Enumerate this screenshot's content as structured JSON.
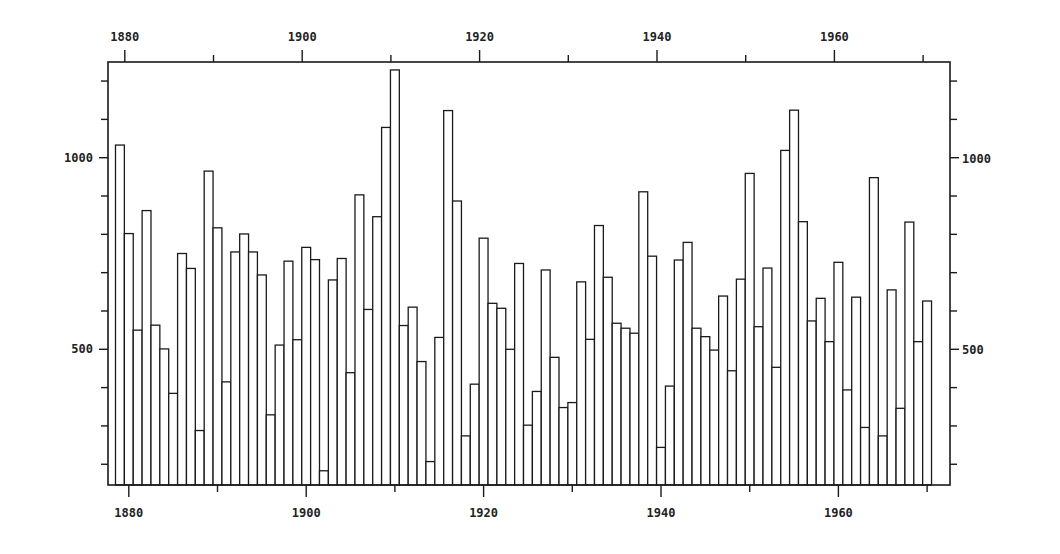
{
  "chart_data": {
    "type": "bar",
    "title": "",
    "xlabel": "",
    "ylabel": "",
    "x_tick_labels_bottom": [
      "1880",
      "1900",
      "1920",
      "1940",
      "1960"
    ],
    "x_tick_labels_top": [
      "1880",
      "1900",
      "1920",
      "1940",
      "1960"
    ],
    "y_tick_labels_left": [
      "500",
      "1000"
    ],
    "y_tick_labels_right": [
      "500",
      "1000"
    ],
    "xlim": [
      1878.5,
      1978
    ],
    "ylim": [
      143,
      1250
    ],
    "y_minor_tick_step": 100,
    "y_minor_ticks": [
      200,
      300,
      400,
      500,
      600,
      700,
      800,
      900,
      1000,
      1100,
      1200
    ],
    "x_minor_ticks": [
      1880,
      1890,
      1900,
      1910,
      1920,
      1930,
      1940,
      1950,
      1960,
      1970
    ],
    "grid": false,
    "legend": null,
    "style": "outlined histogram bars, no fill",
    "categories": [
      1879,
      1880,
      1881,
      1882,
      1883,
      1884,
      1885,
      1886,
      1887,
      1888,
      1889,
      1890,
      1891,
      1892,
      1893,
      1894,
      1895,
      1896,
      1897,
      1898,
      1899,
      1900,
      1901,
      1902,
      1903,
      1904,
      1905,
      1906,
      1907,
      1908,
      1909,
      1910,
      1911,
      1912,
      1913,
      1914,
      1915,
      1916,
      1917,
      1918,
      1919,
      1920,
      1921,
      1922,
      1923,
      1924,
      1925,
      1926,
      1927,
      1928,
      1929,
      1930,
      1931,
      1932,
      1933,
      1934,
      1935,
      1936,
      1937,
      1938,
      1939,
      1940,
      1941,
      1942,
      1943,
      1944,
      1945,
      1946,
      1947,
      1948,
      1949,
      1950,
      1951,
      1952,
      1953,
      1954,
      1955,
      1956,
      1957,
      1958,
      1959,
      1960,
      1961,
      1962,
      1963,
      1964,
      1965,
      1966,
      1967,
      1968,
      1969,
      1970
    ],
    "values": [
      1033,
      802,
      550,
      862,
      563,
      501,
      385,
      750,
      711,
      288,
      965,
      817,
      415,
      754,
      801,
      754,
      694,
      329,
      511,
      730,
      525,
      766,
      734,
      183,
      681,
      737,
      439,
      903,
      604,
      846,
      1079,
      1229,
      562,
      610,
      468,
      207,
      531,
      1123,
      887,
      274,
      409,
      790,
      620,
      607,
      500,
      724,
      302,
      390,
      707,
      479,
      348,
      361,
      676,
      526,
      823,
      688,
      568,
      555,
      542,
      911,
      743,
      244,
      404,
      733,
      779,
      555,
      533,
      498,
      639,
      444,
      683,
      959,
      559,
      712,
      453,
      1019,
      1124,
      833,
      574,
      633,
      520,
      727,
      394,
      636,
      296,
      948,
      274,
      655,
      346,
      832,
      520,
      626
    ]
  }
}
